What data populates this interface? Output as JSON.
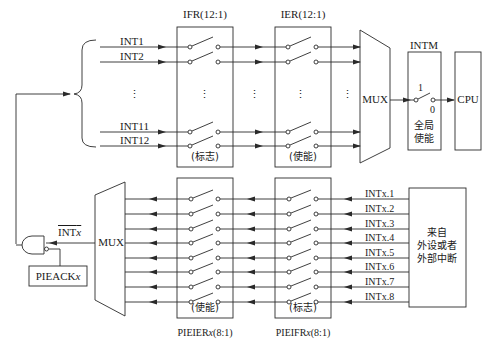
{
  "diagram": {
    "top": {
      "ifr_label": "IFR(12:1)",
      "ier_label": "IER(12:1)",
      "ifr_caption": "(标志)",
      "ier_caption": "(使能)",
      "inputs": [
        "INT1",
        "INT2",
        "INT11",
        "INT12"
      ],
      "ellipsis": "⋮",
      "mux_label": "MUX",
      "intm_label": "INTM",
      "intm_switch_on": "1",
      "intm_switch_off": "0",
      "intm_caption_line1": "全局",
      "intm_caption_line2": "使能",
      "cpu_label": "CPU"
    },
    "bottom": {
      "mux_label": "MUX",
      "intx_label": "INT",
      "intx_suffix": "x",
      "pieack_label": "PIEACK",
      "pieack_suffix": "x",
      "pieier_caption": "(使能)",
      "pieifr_caption": "(标志)",
      "pieier_label": "PIEIER",
      "pieier_suffix": "x",
      "pieier_range": "(8:1)",
      "pieifr_label": "PIEIFR",
      "pieifr_suffix": "x",
      "pieifr_range": "(8:1)",
      "inputs": [
        "INTx.1",
        "INTx.2",
        "INTx.3",
        "INTx.4",
        "INTx.5",
        "INTx.6",
        "INTx.7",
        "INTx.8"
      ],
      "source_line1": "来自",
      "source_line2": "外设或者",
      "source_line3": "外部中断"
    },
    "colors": {
      "line": "#2a2a2a",
      "background": "#ffffff"
    }
  }
}
